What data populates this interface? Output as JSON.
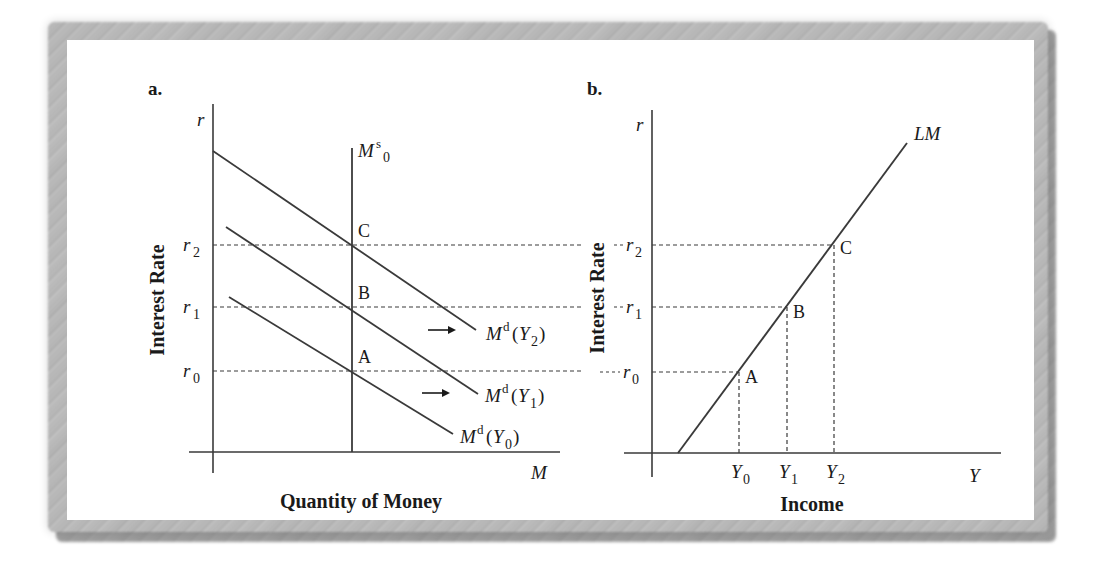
{
  "figure": {
    "panels": [
      {
        "id": "a",
        "label": "a.",
        "y_axis_symbol": "r",
        "x_axis_symbol": "M",
        "y_axis_title": "Interest Rate",
        "x_axis_title": "Quantity of Money",
        "supply_curve": {
          "base": "M",
          "sup": "s",
          "sub": "0"
        },
        "demand_curves": [
          {
            "name": "Md(Y0)",
            "base": "M",
            "sup": "d",
            "arg": "Y",
            "sub": "0"
          },
          {
            "name": "Md(Y1)",
            "base": "M",
            "sup": "d",
            "arg": "Y",
            "sub": "1"
          },
          {
            "name": "Md(Y2)",
            "base": "M",
            "sup": "d",
            "arg": "Y",
            "sub": "2"
          }
        ],
        "rate_ticks": [
          {
            "base": "r",
            "sub": "0"
          },
          {
            "base": "r",
            "sub": "1"
          },
          {
            "base": "r",
            "sub": "2"
          }
        ],
        "points": [
          "A",
          "B",
          "C"
        ],
        "shift_arrows": 2
      },
      {
        "id": "b",
        "label": "b.",
        "y_axis_symbol": "r",
        "x_axis_symbol": "Y",
        "y_axis_title": "Interest Rate",
        "x_axis_title": "Income",
        "curve_label": "LM",
        "rate_ticks": [
          {
            "base": "r",
            "sub": "0"
          },
          {
            "base": "r",
            "sub": "1"
          },
          {
            "base": "r",
            "sub": "2"
          }
        ],
        "income_ticks": [
          {
            "base": "Y",
            "sub": "0"
          },
          {
            "base": "Y",
            "sub": "1"
          },
          {
            "base": "Y",
            "sub": "2"
          }
        ],
        "points": [
          "A",
          "B",
          "C"
        ]
      }
    ]
  },
  "colors": {
    "line": "#3a3a3a",
    "text": "#1a1a1a",
    "background": "#ffffff"
  }
}
